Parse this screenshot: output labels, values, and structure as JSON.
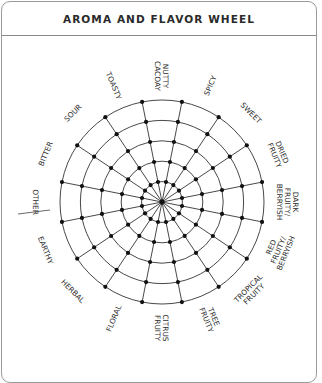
{
  "card": {
    "title": "AROMA AND FLAVOR WHEEL"
  },
  "wheel": {
    "center": [
      162,
      202
    ],
    "ring_count": 5,
    "outer_radius": 102,
    "spoke_count": 16,
    "line_color": "#333333",
    "dot_color": "#111111",
    "labels": [
      {
        "lines": [
          "NUTTY",
          "CACOAY"
        ]
      },
      {
        "lines": [
          "SPICY"
        ]
      },
      {
        "lines": [
          "SWEET"
        ]
      },
      {
        "lines": [
          "DRIED",
          "FRUITY"
        ]
      },
      {
        "lines": [
          "DARK",
          "FRUITY/",
          "BERRYISH"
        ]
      },
      {
        "lines": [
          "RED",
          "FRUITY/",
          "BERRYISH"
        ]
      },
      {
        "lines": [
          "TROPICAL",
          "FRUITY"
        ]
      },
      {
        "lines": [
          "TREE",
          "FRUITY"
        ]
      },
      {
        "lines": [
          "CITRUS",
          "FRUITY"
        ]
      },
      {
        "lines": [
          "FLORAL"
        ]
      },
      {
        "lines": [
          "HERBAL"
        ]
      },
      {
        "lines": [
          "EARTHY"
        ]
      },
      {
        "lines": [
          "OTHER"
        ],
        "underline": true
      },
      {
        "lines": [
          "BITTER"
        ]
      },
      {
        "lines": [
          "SOUR"
        ]
      },
      {
        "lines": [
          "TOASTY"
        ]
      }
    ]
  }
}
